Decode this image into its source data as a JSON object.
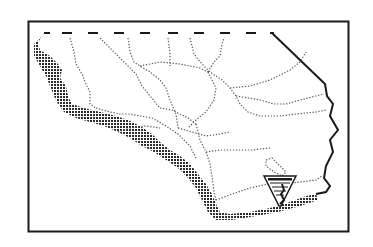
{
  "map": {
    "title": "Southern California region map",
    "frame_color": "#1a1a1a",
    "coast_color": "#2b2b2b",
    "boundary_color": "#555555",
    "land_color": "#ffffff",
    "background": "#ffffff",
    "logo": {
      "icon": "blm-shield-icon",
      "label": "Agency logo"
    }
  }
}
